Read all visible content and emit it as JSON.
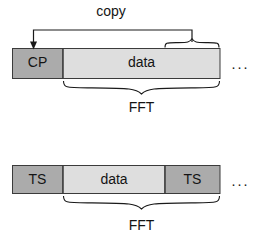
{
  "figure": {
    "colors": {
      "guard_fill": "#ababab",
      "data_fill": "#dedede",
      "outline": "#3b3b3b",
      "line": "#1a1a1a",
      "text": "#141414",
      "background": "#ffffff"
    },
    "annotations": {
      "copy_label": "copy",
      "ellipsis": "···"
    },
    "blocks": [
      {
        "id": "cp-block",
        "segments": [
          {
            "name": "cp",
            "label": "CP",
            "fill": "guard"
          },
          {
            "name": "data",
            "label": "data",
            "fill": "data"
          }
        ],
        "brace_label": "FFT"
      },
      {
        "id": "ts-block",
        "segments": [
          {
            "name": "ts-left",
            "label": "TS",
            "fill": "guard"
          },
          {
            "name": "data",
            "label": "data",
            "fill": "data"
          },
          {
            "name": "ts-right",
            "label": "TS",
            "fill": "guard"
          }
        ],
        "brace_label": "FFT"
      }
    ]
  }
}
